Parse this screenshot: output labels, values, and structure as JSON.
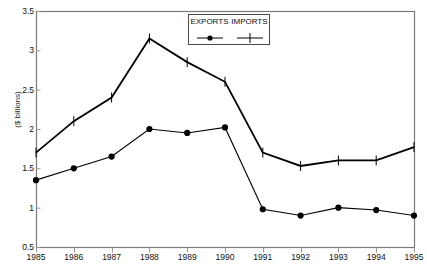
{
  "chart_data": {
    "type": "line",
    "title": "",
    "xlabel": "",
    "ylabel": "($ billions)",
    "categories": [
      "1985",
      "1986",
      "1987",
      "1988",
      "1989",
      "1990",
      "1991",
      "1992",
      "1993",
      "1994",
      "1995"
    ],
    "x": [
      1985,
      1986,
      1987,
      1988,
      1989,
      1990,
      1991,
      1992,
      1993,
      1994,
      1995
    ],
    "series": [
      {
        "name": "EXPORTS",
        "marker": "filled-circle",
        "color": "#000000",
        "values": [
          1.35,
          1.5,
          1.65,
          2.0,
          1.95,
          2.02,
          0.98,
          0.9,
          1.0,
          0.97,
          0.9
        ]
      },
      {
        "name": "IMPORTS",
        "marker": "plus-cross",
        "color": "#000000",
        "values": [
          1.7,
          2.1,
          2.4,
          3.15,
          2.85,
          2.6,
          1.7,
          1.53,
          1.6,
          1.6,
          1.77
        ]
      }
    ],
    "ylim": [
      0.5,
      3.5
    ],
    "yticks": [
      0.5,
      1,
      1.5,
      2,
      2.5,
      3,
      3.5
    ],
    "ytick_labels": [
      "0.5",
      "1",
      "1.5",
      "2",
      "2.5",
      "3",
      "3.5"
    ],
    "xlim": [
      1985,
      1995
    ],
    "grid": false,
    "legend_position": "top-right",
    "legend_entries": [
      "EXPORTS",
      "IMPORTS"
    ]
  }
}
